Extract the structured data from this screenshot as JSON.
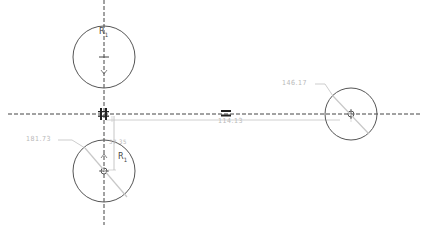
{
  "drawing": {
    "type": "2D sketch",
    "colors": {
      "geometry": "#555555",
      "centerline": "#444444",
      "dimension": "#b0b0b0",
      "constraint": "#222222",
      "background": "#ffffff"
    },
    "circles": [
      {
        "id": "circle-top",
        "cx": 104,
        "cy": 57,
        "r": 31,
        "label": "R",
        "label_sub": "1"
      },
      {
        "id": "circle-bottom",
        "cx": 104,
        "cy": 171,
        "r": 31,
        "label": "R",
        "label_sub": "1"
      },
      {
        "id": "circle-right",
        "cx": 351,
        "cy": 114,
        "r": 26
      }
    ],
    "centerlines": {
      "horizontal_y": 114,
      "vertical_x": 104
    },
    "dimensions": [
      {
        "id": "dim-bottom-diameter",
        "text": "181.73"
      },
      {
        "id": "dim-right-diameter",
        "text": "146.17"
      },
      {
        "id": "dim-horizontal-distance",
        "text": "114.13"
      },
      {
        "id": "dim-vertical-offset",
        "text": "57.35"
      }
    ],
    "constraints": [
      {
        "id": "parallel-constraint",
        "symbol": "parallel"
      },
      {
        "id": "equal-constraint",
        "symbol": "equal",
        "glyph": "="
      }
    ]
  }
}
